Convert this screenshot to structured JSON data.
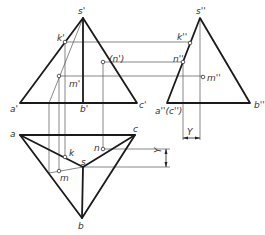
{
  "figure": {
    "type": "three-view projection of triangular pyramid",
    "front_view": {
      "labels": {
        "s": "s'",
        "a": "a'",
        "b": "b'",
        "c": "c'",
        "k": "k'",
        "m": "m'",
        "n": "(n')"
      }
    },
    "side_view": {
      "labels": {
        "s": "s''",
        "ac": "a''(c'')",
        "b": "b''",
        "k": "k''",
        "n": "n''",
        "m": "m''"
      }
    },
    "top_view": {
      "labels": {
        "a": "a",
        "b": "b",
        "c": "c",
        "s": "s",
        "k": "k",
        "m": "m",
        "n": "n"
      }
    },
    "dimensions": {
      "y_side": "Y",
      "y_top": "Y"
    }
  }
}
